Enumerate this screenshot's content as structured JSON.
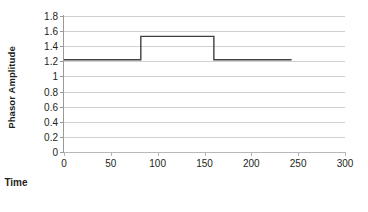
{
  "chart_data": {
    "type": "line",
    "title": "",
    "xlabel": "Time",
    "ylabel": "Phasor Amplitude",
    "xlim": [
      0,
      300
    ],
    "ylim": [
      0,
      1.8
    ],
    "grid": true,
    "legend": false,
    "xticks": [
      0,
      50,
      100,
      150,
      200,
      250,
      300
    ],
    "xtick_labels": [
      "0",
      "50",
      "100",
      "150",
      "200",
      "250",
      "300"
    ],
    "yticks": [
      0,
      0.2,
      0.4,
      0.6,
      0.8,
      1,
      1.2,
      1.4,
      1.6,
      1.8
    ],
    "ytick_labels": [
      "0",
      "0.2",
      "0.4",
      "0.6",
      "0.8",
      "1",
      "1.2",
      "1.4",
      "1.6",
      "1.8"
    ],
    "series": [
      {
        "name": "Phasor Amplitude",
        "color": "#404040",
        "x": [
          0,
          82,
          82,
          160,
          160,
          243
        ],
        "values": [
          1.22,
          1.22,
          1.53,
          1.53,
          1.22,
          1.22
        ]
      }
    ],
    "annotations": {
      "baseline_level": 1.22,
      "step_level": 1.53,
      "step_start_time": 82,
      "step_end_time": 160,
      "data_end_time": 243
    }
  },
  "colors": {
    "series_line": "#404040",
    "gridline": "#d0d0d0",
    "axis": "#9a9a9a",
    "text": "#231f20",
    "background": "#ffffff"
  }
}
